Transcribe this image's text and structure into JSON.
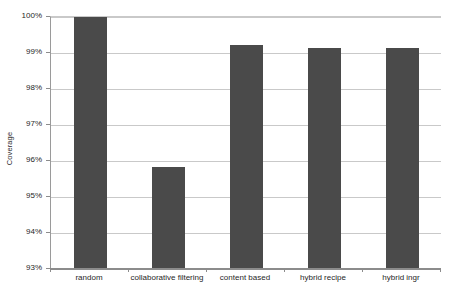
{
  "chart_data": {
    "type": "bar",
    "title": "",
    "subtitle": "",
    "xlabel": "",
    "ylabel": "Coverage",
    "categories": [
      "random",
      "collaborative filtering",
      "content based",
      "hybrid recipe",
      "hybrid ingr"
    ],
    "values": [
      100.0,
      95.83,
      99.22,
      99.15,
      99.15
    ],
    "value_format": "percent",
    "ylim": [
      93,
      100
    ],
    "ytick_labels": [
      "100%",
      "99%",
      "98%",
      "97%",
      "96%",
      "95%",
      "94%",
      "93%"
    ],
    "ytick_values": [
      100,
      99,
      98,
      97,
      96,
      95,
      94,
      93
    ],
    "grid": true,
    "grid_axis": "y",
    "legend": false,
    "legend_position": "none",
    "series": [
      {
        "name": "Coverage",
        "color": "#4a4a4a",
        "values": [
          100.0,
          95.83,
          99.22,
          99.15,
          99.15
        ]
      }
    ]
  },
  "axes": {
    "y_title": "Coverage"
  }
}
